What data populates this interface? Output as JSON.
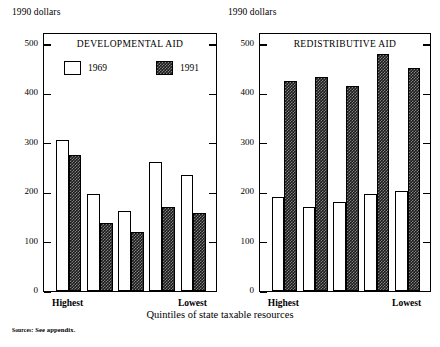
{
  "units_label_left": "1990 dollars",
  "units_label_right": "1990 dollars",
  "xaxis_title": "Quintiles of state taxable resources",
  "source_prefix": "Sources",
  "source_text": ": See appendix.",
  "legend": {
    "items": [
      {
        "label": "1969",
        "swatch": "open-white"
      },
      {
        "label": "1991",
        "swatch": "dark-checkered"
      }
    ]
  },
  "axis": {
    "ticks": [
      "500",
      "400",
      "300",
      "200",
      "100",
      "0"
    ],
    "tick_values": [
      500,
      400,
      300,
      200,
      100,
      0
    ],
    "ymin": 0,
    "ymax": 520
  },
  "category_labels": {
    "first": "Highest",
    "last": "Lowest"
  },
  "chart_data": [
    {
      "type": "bar",
      "title": "DEVELOPMENTAL AID",
      "categories": [
        "Highest",
        "Q2",
        "Q3",
        "Q4",
        "Lowest"
      ],
      "series": [
        {
          "name": "1969",
          "values": [
            305,
            197,
            162,
            261,
            234
          ]
        },
        {
          "name": "1991",
          "values": [
            276,
            137,
            120,
            169,
            157
          ]
        }
      ],
      "xlabel": "Quintiles of state taxable resources",
      "ylabel": "1990 dollars",
      "ylim": [
        0,
        520
      ],
      "yticks": [
        0,
        100,
        200,
        300,
        400,
        500
      ],
      "grid": false,
      "legend_position": "inside-top"
    },
    {
      "type": "bar",
      "title": "REDISTRIBUTIVE AID",
      "categories": [
        "Highest",
        "Q2",
        "Q3",
        "Q4",
        "Lowest"
      ],
      "series": [
        {
          "name": "1969",
          "values": [
            190,
            170,
            180,
            197,
            203
          ]
        },
        {
          "name": "1991",
          "values": [
            425,
            433,
            415,
            479,
            452
          ]
        }
      ],
      "xlabel": "Quintiles of state taxable resources",
      "ylabel": "1990 dollars",
      "ylim": [
        0,
        520
      ],
      "yticks": [
        0,
        100,
        200,
        300,
        400,
        500
      ],
      "grid": false,
      "legend_position": "none"
    }
  ]
}
